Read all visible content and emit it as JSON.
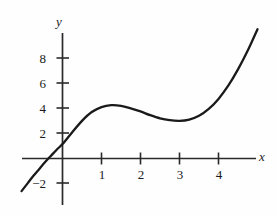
{
  "figure": {
    "kind": "cubic-function-graph",
    "background_color": "#fefefe",
    "curve_color": "#1a1a1a",
    "axis_color": "#2a2a2a"
  },
  "axes": {
    "x_axis_label": "x",
    "y_axis_label": "y",
    "x_ticks": [
      {
        "value": 1,
        "label": "1"
      },
      {
        "value": 2,
        "label": "2"
      },
      {
        "value": 3,
        "label": "3"
      },
      {
        "value": 4,
        "label": "4"
      }
    ],
    "y_ticks": [
      {
        "value": 8,
        "label": "8"
      },
      {
        "value": 6,
        "label": "6"
      },
      {
        "value": 4,
        "label": "4"
      },
      {
        "value": 2,
        "label": "2"
      },
      {
        "value": -2,
        "label": "−2"
      }
    ]
  },
  "chart_data": {
    "type": "line",
    "title": "",
    "subtitle": "",
    "xlabel": "x",
    "ylabel": "y",
    "xlim": [
      -1.05,
      5.0
    ],
    "ylim": [
      -3.2,
      10.2
    ],
    "grid": false,
    "legend": null,
    "annotations": [],
    "xticks": [
      1,
      2,
      3,
      4
    ],
    "xticklabels": [
      "1",
      "2",
      "3",
      "4"
    ],
    "yticks": [
      -2,
      2,
      4,
      6,
      8
    ],
    "yticklabels": [
      "−2",
      "2",
      "4",
      "6",
      "8"
    ],
    "series": [
      {
        "name": "f(x)",
        "expression": "x^3 - 6x^2 + 9x scaled: f(x) = (x^3 - 6x^2 + 9x)/3 + 2.95",
        "x": [
          -1.05,
          -0.9,
          -0.75,
          -0.6,
          -0.45,
          -0.3,
          -0.15,
          0,
          0.25,
          0.5,
          0.75,
          1,
          1.25,
          1.5,
          1.75,
          2,
          2.25,
          2.5,
          2.75,
          3,
          3.25,
          3.5,
          3.75,
          4,
          4.25,
          4.5,
          4.75,
          5
        ],
        "y": [
          -2.6,
          -2.0,
          -1.4,
          -0.85,
          -0.3,
          0.2,
          0.7,
          1.15,
          2.1,
          3.0,
          3.7,
          4.1,
          4.25,
          4.2,
          4.0,
          3.75,
          3.45,
          3.2,
          3.05,
          3.0,
          3.1,
          3.4,
          3.95,
          4.75,
          5.8,
          7.1,
          8.6,
          10.3
        ]
      }
    ],
    "features": {
      "local_maximum": {
        "x": 1,
        "y": 4.1
      },
      "local_minimum": {
        "x": 3,
        "y": 3.0
      },
      "y_intercept": {
        "x": 0,
        "y": 2.6
      },
      "x_intercept": {
        "x": -0.4,
        "y": 0
      }
    }
  }
}
